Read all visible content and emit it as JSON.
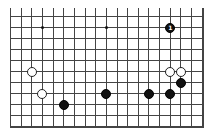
{
  "diagram": {
    "type": "go-board-fragment",
    "columns": 19,
    "rows_visible": 11,
    "open_edges": [
      "top"
    ],
    "star_points": [
      {
        "col": 3,
        "row": 1
      },
      {
        "col": 9,
        "row": 1
      }
    ],
    "stones": [
      {
        "color": "black",
        "col": 15,
        "row": 1,
        "label": "1"
      },
      {
        "color": "white",
        "col": 2,
        "row": 5,
        "label": ""
      },
      {
        "color": "white",
        "col": 3,
        "row": 7,
        "label": ""
      },
      {
        "color": "black",
        "col": 5,
        "row": 8,
        "label": ""
      },
      {
        "color": "black",
        "col": 9,
        "row": 7,
        "label": ""
      },
      {
        "color": "black",
        "col": 13,
        "row": 7,
        "label": ""
      },
      {
        "color": "black",
        "col": 15,
        "row": 7,
        "label": ""
      },
      {
        "color": "black",
        "col": 16,
        "row": 6,
        "label": ""
      },
      {
        "color": "white",
        "col": 15,
        "row": 5,
        "label": ""
      },
      {
        "color": "white",
        "col": 16,
        "row": 5,
        "label": ""
      }
    ]
  },
  "colors": {
    "line": "#444444",
    "black_stone": "#111111",
    "white_stone": "#ffffff"
  }
}
